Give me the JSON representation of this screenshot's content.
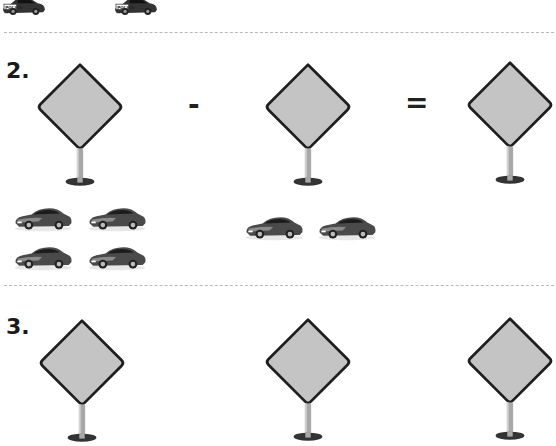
{
  "worksheet": {
    "previous_problem": {
      "cars": [
        {
          "label": "POLICE",
          "icon": "police-car-icon"
        },
        {
          "label": "POLICE",
          "icon": "police-car-icon"
        }
      ]
    },
    "problem_2": {
      "number": "2.",
      "operator_minus": "-",
      "operator_equals": "=",
      "minuend_car_count": 4,
      "subtrahend_car_count": 2,
      "answer_box": ""
    },
    "problem_3": {
      "number": "3."
    },
    "colors": {
      "sign_fill": "#c4c4c4",
      "sign_border": "#1e1e1e",
      "pole": "#a8a8a8",
      "base": "#333333",
      "divider": "#b8b8b8"
    }
  }
}
